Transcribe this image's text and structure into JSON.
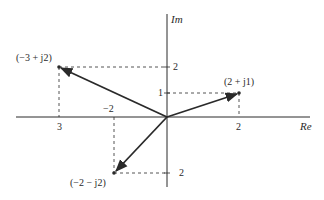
{
  "diagram": {
    "axes": {
      "real_label": "Re",
      "imag_label": "Im"
    },
    "tick_labels": {
      "re_neg3": "3",
      "re_neg2": "−2",
      "re_pos2": "2",
      "im_pos2": "2",
      "im_pos1": "1",
      "im_neg2": "2"
    },
    "points": [
      {
        "label": "(−3 + j2)",
        "re": -3,
        "im": 2
      },
      {
        "label": "(2 + j1)",
        "re": 2,
        "im": 1
      },
      {
        "label": "(−2 − j2)",
        "re": -2,
        "im": -2
      }
    ],
    "colors": {
      "ink": "#2a2a2a",
      "background": "#ffffff"
    }
  }
}
